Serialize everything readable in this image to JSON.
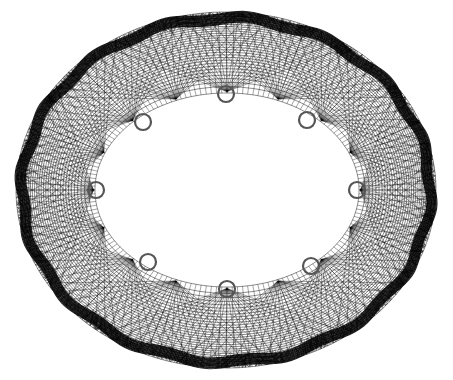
{
  "diagram": {
    "type": "wireframe-torus",
    "background": "#ffffff",
    "line_color": "#000000",
    "marker_color": "#555555",
    "outer_ellipse": {
      "cx": 226,
      "cy": 190,
      "rx": 210,
      "ry": 178
    },
    "inner_ellipse": {
      "cx": 227,
      "cy": 190,
      "rx": 132,
      "ry": 97
    },
    "segments": 16,
    "rings": 10,
    "markers": [
      {
        "id": "m1",
        "x": 226,
        "y": 94
      },
      {
        "id": "m2",
        "x": 307,
        "y": 120
      },
      {
        "id": "m3",
        "x": 357,
        "y": 190
      },
      {
        "id": "m4",
        "x": 311,
        "y": 266
      },
      {
        "id": "m5",
        "x": 227,
        "y": 289
      },
      {
        "id": "m6",
        "x": 148,
        "y": 262
      },
      {
        "id": "m7",
        "x": 96,
        "y": 190
      },
      {
        "id": "m8",
        "x": 143,
        "y": 122
      }
    ],
    "marker_radius": 8
  }
}
